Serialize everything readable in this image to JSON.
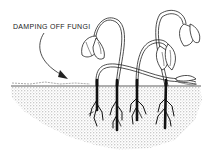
{
  "figure": {
    "callout_label": "DAMPING OFF FUNGI",
    "colors": {
      "ink": "#222222",
      "soil_stipple": "#9a9a9a",
      "background": "#ffffff"
    },
    "elements": [
      {
        "name": "soil",
        "description": "stippled soil cross-section"
      },
      {
        "name": "soil-surface-line",
        "description": "ground line with debris"
      },
      {
        "name": "callout-arrow",
        "description": "curved arrow pointing to soil line"
      },
      {
        "name": "seedling-1",
        "description": "wilted seedling with drooping leaves, dark rotted stem base"
      },
      {
        "name": "seedling-2",
        "description": "collapsed seedling lying along soil"
      },
      {
        "name": "seedling-3",
        "description": "arched seedling stem"
      },
      {
        "name": "seedling-4",
        "description": "tall wilted seedling with drooping leaves"
      }
    ],
    "seedling_count": 4
  }
}
